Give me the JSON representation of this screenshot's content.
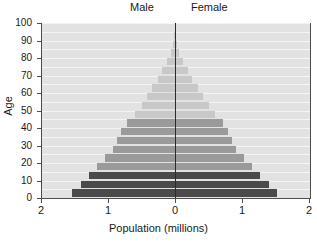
{
  "header": {
    "male_label": "Male",
    "female_label": "Female"
  },
  "axes": {
    "ylabel": "Age",
    "xlabel": "Population (millions)",
    "xticks": [
      "2",
      "1",
      "0",
      "1",
      "2"
    ],
    "yticks": [
      "0",
      "10",
      "20",
      "30",
      "40",
      "50",
      "60",
      "70",
      "80",
      "90",
      "100"
    ]
  },
  "colors": {
    "plot_background": "#e2e2e2",
    "gridline": "#f4f4f4",
    "axis": "#4d4d4d",
    "center_axis": "#2b2b2b",
    "bar_dark": "#4a4a4a",
    "bar_medium": "#9a9a9a",
    "bar_light": "#c8c8c8",
    "text": "#1a1a1a"
  },
  "chart_data": {
    "type": "bar",
    "chart_subtype": "population-pyramid",
    "title": "",
    "xlabel": "Population (millions)",
    "ylabel": "Age",
    "xlim": [
      -2,
      2
    ],
    "ylim": [
      0,
      100
    ],
    "xtick_values": [
      -2,
      -1,
      0,
      1,
      2
    ],
    "xtick_labels": [
      "2",
      "1",
      "0",
      "1",
      "2"
    ],
    "ytick_values": [
      0,
      10,
      20,
      30,
      40,
      50,
      60,
      70,
      80,
      90,
      100
    ],
    "grid": true,
    "legend": "none",
    "age_band_width": 5,
    "categories": [
      "0-4",
      "5-9",
      "10-14",
      "15-19",
      "20-24",
      "25-29",
      "30-34",
      "35-39",
      "40-44",
      "45-49",
      "50-54",
      "55-59",
      "60-64",
      "65-69",
      "70-74",
      "75-79",
      "80-84",
      "85-89",
      "90-94",
      "95-99",
      "100+"
    ],
    "series": [
      {
        "name": "Male",
        "direction": "left",
        "values": [
          1.53,
          1.4,
          1.28,
          1.16,
          1.04,
          0.92,
          0.86,
          0.8,
          0.72,
          0.6,
          0.5,
          0.42,
          0.34,
          0.26,
          0.19,
          0.12,
          0.06,
          0.03,
          0.01,
          0.0,
          0.0
        ]
      },
      {
        "name": "Female",
        "direction": "right",
        "values": [
          1.52,
          1.4,
          1.27,
          1.15,
          1.03,
          0.91,
          0.85,
          0.79,
          0.71,
          0.6,
          0.5,
          0.42,
          0.34,
          0.26,
          0.19,
          0.12,
          0.06,
          0.03,
          0.01,
          0.0,
          0.0
        ]
      }
    ],
    "band_colors": [
      "#4a4a4a",
      "#4a4a4a",
      "#4a4a4a",
      "#9a9a9a",
      "#9a9a9a",
      "#9a9a9a",
      "#9a9a9a",
      "#9a9a9a",
      "#9a9a9a",
      "#c8c8c8",
      "#c8c8c8",
      "#c8c8c8",
      "#c8c8c8",
      "#c8c8c8",
      "#c8c8c8",
      "#c8c8c8",
      "#c8c8c8",
      "#c8c8c8",
      "#c8c8c8",
      "#c8c8c8",
      "#c8c8c8"
    ]
  }
}
